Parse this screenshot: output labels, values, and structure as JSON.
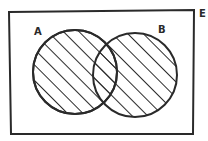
{
  "diagram": {
    "type": "venn",
    "universal_set_label": "E",
    "sets": [
      {
        "label": "A",
        "shaded": true
      },
      {
        "label": "B",
        "shaded": true
      }
    ],
    "shaded_region": "A ∪ B",
    "stroke_color": "#2a2a2a",
    "background": "#ffffff"
  }
}
